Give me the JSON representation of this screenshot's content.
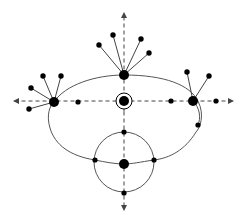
{
  "diagram": {
    "title": "",
    "colors": {
      "background": "#ffffff",
      "node": "#000000",
      "curve": "#555555",
      "axis": "#444444",
      "edge": "#444444"
    },
    "axes": {
      "vertical": {
        "x": 124,
        "y1": 13,
        "y2": 210,
        "arrows": "both",
        "style": "dashed"
      },
      "horizontal": {
        "y": 101,
        "x1": 14,
        "x2": 233,
        "arrows": "both",
        "style": "dashed"
      }
    },
    "hubs": [
      {
        "id": "top-hub",
        "x": 124,
        "y": 75,
        "r": 5,
        "leaves": [
          {
            "x": 99,
            "y": 45
          },
          {
            "x": 113,
            "y": 35
          },
          {
            "x": 141,
            "y": 39
          },
          {
            "x": 149,
            "y": 53
          }
        ]
      },
      {
        "id": "left-hub",
        "x": 54,
        "y": 102,
        "r": 5,
        "leaves": [
          {
            "x": 43,
            "y": 76
          },
          {
            "x": 61,
            "y": 76
          },
          {
            "x": 31,
            "y": 88
          },
          {
            "x": 29,
            "y": 109
          }
        ]
      },
      {
        "id": "right-hub",
        "x": 193,
        "y": 101,
        "r": 5,
        "leaves": [
          {
            "x": 187,
            "y": 72
          },
          {
            "x": 209,
            "y": 76
          }
        ]
      },
      {
        "id": "bottom-hub",
        "x": 124,
        "y": 164,
        "r": 5,
        "leaves": []
      }
    ],
    "center_node": {
      "x": 124,
      "y": 101,
      "r": 5,
      "ring_r": 8
    },
    "small_nodes": [
      {
        "id": "left-axis-node",
        "x": 78,
        "y": 102,
        "r": 2.6
      },
      {
        "id": "right-inner-node",
        "x": 171,
        "y": 101,
        "r": 2.6
      },
      {
        "id": "right-outer-node",
        "x": 216,
        "y": 101,
        "r": 2.6
      },
      {
        "id": "right-lower-node",
        "x": 198,
        "y": 125,
        "r": 2.6
      },
      {
        "id": "circle-top-node",
        "x": 124,
        "y": 132,
        "r": 2.6
      },
      {
        "id": "circle-left-node",
        "x": 95,
        "y": 160,
        "r": 2.6
      },
      {
        "id": "circle-right-node",
        "x": 154,
        "y": 160,
        "r": 2.6
      },
      {
        "id": "circle-bottom-node",
        "x": 124,
        "y": 193,
        "r": 2.6
      }
    ],
    "bottom_circle": {
      "cx": 124,
      "cy": 162,
      "r": 30
    }
  }
}
